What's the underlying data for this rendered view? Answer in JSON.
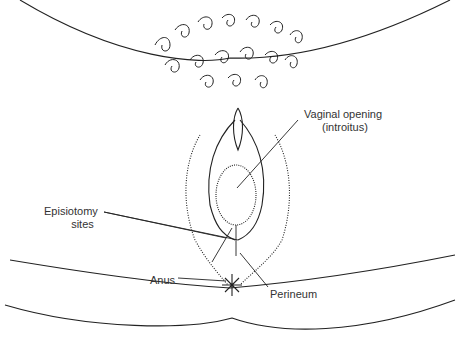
{
  "diagram": {
    "type": "anatomical line drawing",
    "labels": {
      "vaginal_opening_line1": "Vaginal opening",
      "vaginal_opening_line2": "(introitus)",
      "episiotomy_line1": "Episiotomy",
      "episiotomy_line2": "sites",
      "anus": "Anus",
      "perineum": "Perineum"
    }
  }
}
